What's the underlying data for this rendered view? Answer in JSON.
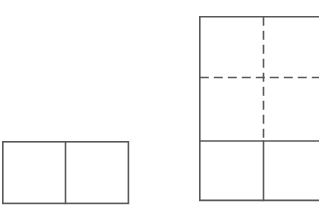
{
  "figure": {
    "background_color": "#ffffff",
    "line_color": "#585858",
    "stroke_width": 1.6,
    "dash_pattern": "9 5",
    "canvas": {
      "width": 319,
      "height": 214
    },
    "shapes": [
      {
        "id": "left-rectangle",
        "name": "rectangle-divided-into-two-squares",
        "type": "rectangle",
        "line_style": "solid",
        "x": 2,
        "y": 141,
        "width": 127,
        "height": 63
      },
      {
        "id": "left-rectangle-divider",
        "name": "vertical-divider-line",
        "type": "line",
        "line_style": "solid",
        "x1": 65.5,
        "y1": 141,
        "x2": 65.5,
        "y2": 204
      },
      {
        "id": "right-square",
        "name": "large-square-cropped-at-right-edge",
        "type": "rectangle",
        "line_style": "solid",
        "x": 199,
        "y": 16,
        "width": 128,
        "height": 185
      },
      {
        "id": "right-horizontal-dashed",
        "name": "horizontal-dashed-line",
        "type": "line",
        "line_style": "dashed",
        "x1": 199,
        "y1": 77.5,
        "x2": 327,
        "y2": 77.5
      },
      {
        "id": "right-vertical-dashed",
        "name": "vertical-dashed-line",
        "type": "line",
        "line_style": "dashed",
        "x1": 263.5,
        "y1": 16,
        "x2": 263.5,
        "y2": 141
      },
      {
        "id": "right-horizontal-solid",
        "name": "horizontal-solid-line",
        "type": "line",
        "line_style": "solid",
        "x1": 199,
        "y1": 141,
        "x2": 327,
        "y2": 141
      },
      {
        "id": "right-vertical-solid",
        "name": "vertical-solid-line",
        "type": "line",
        "line_style": "solid",
        "x1": 263.5,
        "y1": 141,
        "x2": 263.5,
        "y2": 201
      }
    ]
  }
}
